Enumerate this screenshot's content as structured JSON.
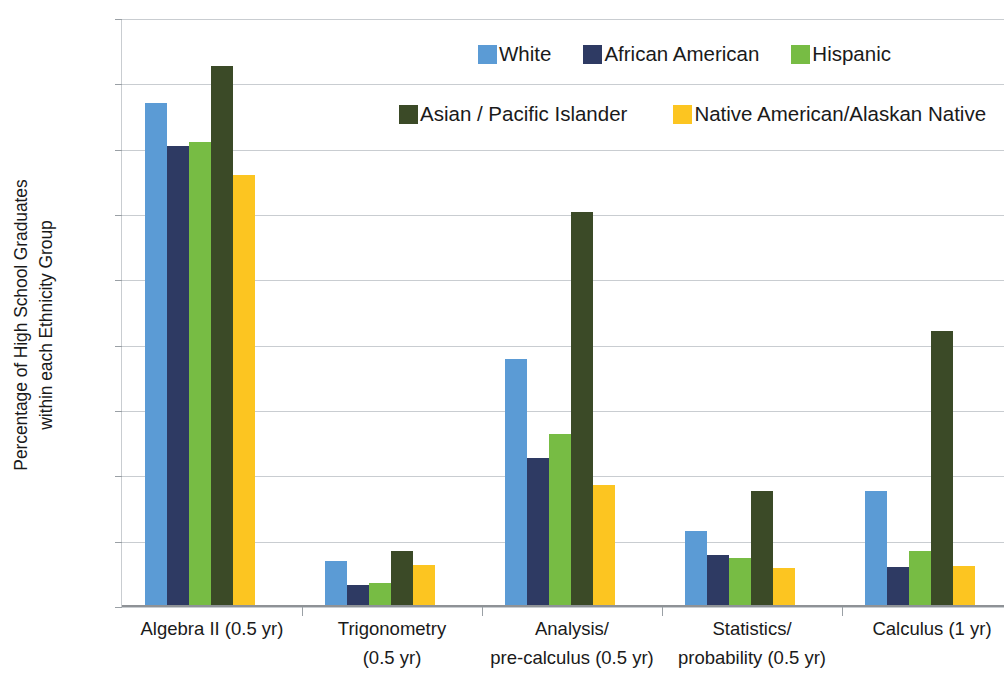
{
  "chart_data": {
    "type": "bar",
    "title": "",
    "subtitle": "",
    "xlabel": "",
    "ylabel": "Percentage of High School Graduates\nwithin each Ethnicity Group",
    "ylim": [
      0,
      90
    ],
    "ytick_values": [
      0,
      10,
      20,
      30,
      40,
      50,
      60,
      70,
      80,
      90
    ],
    "ytick_labels": [
      "0%",
      "10%",
      "20%",
      "30%",
      "40%",
      "50%",
      "60%",
      "70%",
      "80%",
      "90%"
    ],
    "grid": true,
    "legend_position": "top-right",
    "categories": [
      "Algebra II (0.5 yr)",
      "Trigonometry\n(0.5 yr)",
      "Analysis/\npre-calculus (0.5 yr)",
      "Statistics/\nprobability (0.5 yr)",
      "Calculus (1 yr)"
    ],
    "series": [
      {
        "name": "White",
        "color": "#5B9BD5",
        "values": [
          77.1,
          7.0,
          38.0,
          11.6,
          17.7
        ]
      },
      {
        "name": "African American",
        "color": "#2E3A63",
        "values": [
          70.5,
          3.3,
          22.8,
          8.0,
          6.2
        ]
      },
      {
        "name": "Hispanic",
        "color": "#77BC44",
        "values": [
          71.1,
          3.6,
          26.5,
          7.5,
          8.6
        ]
      },
      {
        "name": "Asian / Pacific Islander",
        "color": "#3B4A27",
        "values": [
          82.8,
          8.5,
          60.5,
          17.7,
          42.3
        ]
      },
      {
        "name": "Native American/Alaskan Native",
        "color": "#FCC521",
        "values": [
          66.2,
          6.5,
          18.7,
          5.9,
          6.3
        ]
      }
    ]
  },
  "axis": {
    "y_title": "Percentage of High School Graduates\nwithin each Ethnicity Group"
  },
  "legend": {
    "rows": [
      [
        {
          "label": "White",
          "color": "#5B9BD5"
        },
        {
          "label": "African American",
          "color": "#2E3A63"
        },
        {
          "label": "Hispanic",
          "color": "#77BC44"
        }
      ],
      [
        {
          "label": "Asian / Pacific Islander",
          "color": "#3B4A27"
        },
        {
          "label": "Native American/Alaskan Native",
          "color": "#FCC521"
        }
      ]
    ]
  }
}
